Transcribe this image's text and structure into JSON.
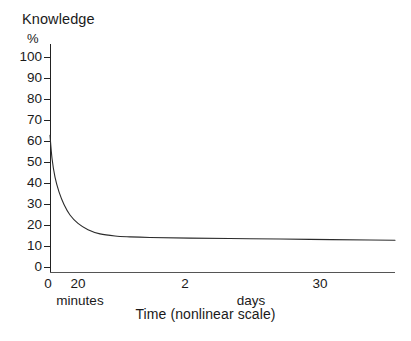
{
  "chart_data": {
    "type": "line",
    "title": "Knowledge",
    "subtitle": "%",
    "xlabel": "Time (nonlinear scale)",
    "ylabel": "Knowledge",
    "yunit": "%",
    "ylim": [
      0,
      100
    ],
    "grid": false,
    "legend": "none",
    "y_ticks": [
      100,
      90,
      80,
      70,
      60,
      50,
      40,
      30,
      20,
      10,
      0
    ],
    "x_tick_labels": [
      "0",
      "20",
      "2",
      "30"
    ],
    "x_group_labels": [
      "minutes",
      "days"
    ],
    "series": [
      {
        "name": "Retention",
        "points": [
          {
            "x": 0,
            "y": 63
          },
          {
            "x": 2,
            "y": 52
          },
          {
            "x": 5,
            "y": 43
          },
          {
            "x": 9,
            "y": 36
          },
          {
            "x": 14,
            "y": 30
          },
          {
            "x": 20,
            "y": 25
          },
          {
            "x": 28,
            "y": 21
          },
          {
            "x": 38,
            "y": 18
          },
          {
            "x": 50,
            "y": 16
          },
          {
            "x": 65,
            "y": 15
          },
          {
            "x": 80,
            "y": 14.6
          },
          {
            "x": 100,
            "y": 14.3
          },
          {
            "x": 140,
            "y": 14.0
          },
          {
            "x": 200,
            "y": 13.7
          },
          {
            "x": 260,
            "y": 13.4
          },
          {
            "x": 320,
            "y": 13.1
          },
          {
            "x": 345,
            "y": 13.0
          }
        ]
      }
    ]
  },
  "axes": {
    "y_title": "Knowledge",
    "y_unit": "%",
    "x_title": "Time (nonlinear scale)",
    "y_ticks": [
      {
        "label": "100",
        "value": 100
      },
      {
        "label": "90",
        "value": 90
      },
      {
        "label": "80",
        "value": 80
      },
      {
        "label": "70",
        "value": 70
      },
      {
        "label": "60",
        "value": 60
      },
      {
        "label": "50",
        "value": 50
      },
      {
        "label": "40",
        "value": 40
      },
      {
        "label": "30",
        "value": 30
      },
      {
        "label": "20",
        "value": 20
      },
      {
        "label": "10",
        "value": 10
      },
      {
        "label": "0",
        "value": 0
      }
    ],
    "x_ticks": [
      {
        "label": "0",
        "px": 48
      },
      {
        "label": "20",
        "px": 78
      },
      {
        "label": "2",
        "px": 185
      },
      {
        "label": "30",
        "px": 320
      }
    ],
    "x_groups": [
      {
        "label": "minutes",
        "px": 80
      },
      {
        "label": "days",
        "px": 251
      }
    ]
  },
  "colors": {
    "curve": "#2b2b2b",
    "axis": "#222222",
    "baseline": "#555555",
    "background": "#ffffff",
    "text": "#1a1a1a"
  }
}
